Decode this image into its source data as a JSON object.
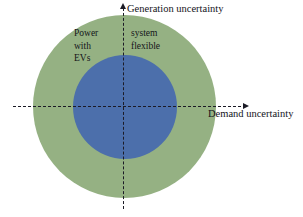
{
  "diagram": {
    "type": "concentric-venn-on-axes",
    "axes": {
      "y_label": "Generation uncertainty",
      "x_label": "Demand uncertainty",
      "y_arrow_icon": "arrow-up-icon",
      "x_arrow_icon": "arrow-right-icon",
      "line_style": "dashed",
      "line_color": "#1b1b26"
    },
    "regions": [
      {
        "name": "outer-region",
        "color": "#95b183",
        "full_phrase": "Power system with flexible EVs",
        "left_lines": [
          "Power",
          "with",
          "EVs"
        ],
        "right_lines": [
          "system",
          "flexible"
        ],
        "text_color": "#141419"
      },
      {
        "name": "inner-region",
        "color": "#4c6fab",
        "full_phrase": "Power system without flexible EVs",
        "lines": [
          "Power system",
          "without",
          "flexible EVs"
        ],
        "text_color": "#ffffff"
      }
    ]
  }
}
